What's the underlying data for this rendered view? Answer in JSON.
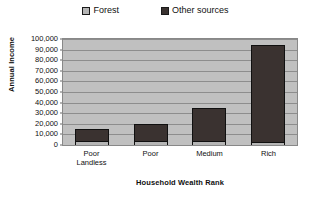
{
  "chart_data": {
    "type": "bar",
    "subtype": "stacked-bar",
    "title": "",
    "xlabel": "Household Wealth Rank",
    "ylabel": "Annual Income",
    "categories": [
      "Poor Landless",
      "Poor",
      "Medium",
      "Rich"
    ],
    "category_lines": [
      [
        "Poor",
        "Landless"
      ],
      [
        "Poor"
      ],
      [
        "Medium"
      ],
      [
        "Rich"
      ]
    ],
    "series": [
      {
        "name": "Forest",
        "values": [
          4000,
          4000,
          4000,
          2500
        ],
        "color": "#b5b5b5"
      },
      {
        "name": "Other sources",
        "values": [
          10000,
          15000,
          30000,
          90500
        ],
        "color": "#3a3230"
      }
    ],
    "totals": [
      14000,
      19000,
      34000,
      93000
    ],
    "ylim": [
      0,
      100000
    ],
    "ytick_values": [
      0,
      10000,
      20000,
      30000,
      40000,
      50000,
      60000,
      70000,
      80000,
      90000,
      100000
    ],
    "ytick_labels": [
      "0",
      "10,000",
      "20,000",
      "30,000",
      "40,000",
      "50,000",
      "60,000",
      "70,000",
      "80,000",
      "90,000",
      "100,000"
    ],
    "grid": true,
    "legend_position": "top-center",
    "plot_background": "#c0c0c0",
    "page_background": "#ffffff"
  },
  "legend": {
    "entries": [
      {
        "label": "Forest",
        "swatch": "#b5b5b5"
      },
      {
        "label": "Other sources",
        "swatch": "#3a3230"
      }
    ]
  },
  "axes": {
    "y_title": "Annual Income",
    "x_title": "Household Wealth Rank"
  }
}
